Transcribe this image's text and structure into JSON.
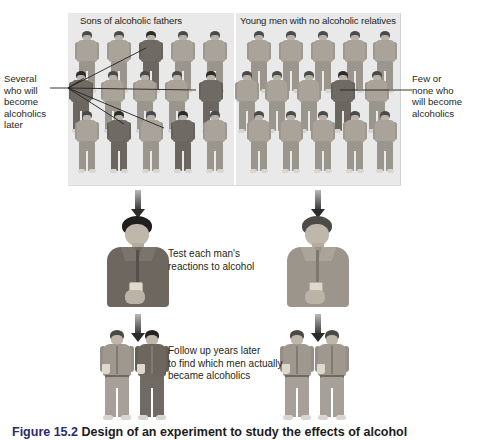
{
  "figure": {
    "caption_number": "Figure 15.2",
    "caption_text": "Design of an experiment to study the effects of alcohol"
  },
  "panel": {
    "groups": [
      {
        "id": "sons-of-alcoholic-fathers",
        "heading": "Sons of alcoholic fathers",
        "rows": 3,
        "per_row": 5,
        "total_figures": 15,
        "highlighted_count": 4,
        "highlighted_indices": [
          2,
          5,
          9,
          12
        ],
        "annotation": "Several who will become alcoholics later",
        "annotation_lines": [
          "Several",
          "who will",
          "become",
          "alcoholics",
          "later"
        ]
      },
      {
        "id": "no-alcoholic-relatives",
        "heading": "Young men with no alcoholic relatives",
        "rows": 3,
        "per_row": 5,
        "total_figures": 15,
        "highlighted_count": 1,
        "highlighted_indices": [
          8
        ],
        "annotation": "Few or none who will become alcoholics",
        "annotation_lines": [
          "Few or",
          "none who",
          "will become",
          "alcoholics"
        ]
      }
    ]
  },
  "steps": [
    {
      "id": "test-reactions",
      "caption": "Test each man's reactions to alcohol",
      "caption_lines": [
        "Test each man's",
        "reactions to alcohol"
      ]
    },
    {
      "id": "follow-up",
      "caption": "Follow up years later to find which men actually became alcoholics",
      "caption_lines": [
        "Follow up years later",
        "to find which men actually",
        "became alcoholics"
      ]
    }
  ],
  "colors": {
    "panel_background": "#e9e9e9",
    "page_background": "#ffffff",
    "text": "#231f20",
    "figure_light": "#9e988f",
    "figure_dark": "#6d6760",
    "arrow": "#2b2b2b",
    "caption_accent": "#2b2b6b"
  }
}
